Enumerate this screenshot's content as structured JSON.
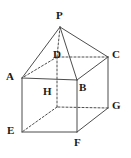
{
  "figure": {
    "background_color": "#ffffff",
    "stroke_color": "#4d4d4d",
    "label_color": "#1a1a1a",
    "solid_stroke_width": 1,
    "dashed_stroke_width": 1,
    "dash_pattern": "2,2",
    "canvas": {
      "width": 131,
      "height": 158
    },
    "vertices": [
      {
        "id": "P",
        "label": "P",
        "x": 60,
        "y": 27,
        "label_x": 56,
        "label_y": 10,
        "hidden": false
      },
      {
        "id": "A",
        "label": "A",
        "x": 22,
        "y": 78,
        "label_x": 6,
        "label_y": 71,
        "hidden": false
      },
      {
        "id": "B",
        "label": "B",
        "x": 77,
        "y": 80,
        "label_x": 79,
        "label_y": 82,
        "hidden": false
      },
      {
        "id": "C",
        "label": "C",
        "x": 108,
        "y": 57,
        "label_x": 112,
        "label_y": 49,
        "hidden": false
      },
      {
        "id": "D",
        "label": "D",
        "x": 57,
        "y": 57,
        "label_x": 53,
        "label_y": 49,
        "hidden": true
      },
      {
        "id": "E",
        "label": "E",
        "x": 22,
        "y": 132,
        "label_x": 7,
        "label_y": 125,
        "hidden": false
      },
      {
        "id": "F",
        "label": "F",
        "x": 77,
        "y": 132,
        "label_x": 74,
        "label_y": 137,
        "hidden": false
      },
      {
        "id": "G",
        "label": "G",
        "x": 108,
        "y": 108,
        "label_x": 112,
        "label_y": 100,
        "hidden": false
      },
      {
        "id": "H",
        "label": "H",
        "x": 57,
        "y": 107,
        "label_x": 43,
        "label_y": 86,
        "hidden": true
      }
    ],
    "edges": [
      {
        "from": "P",
        "to": "A",
        "style": "solid"
      },
      {
        "from": "P",
        "to": "B",
        "style": "solid"
      },
      {
        "from": "P",
        "to": "C",
        "style": "solid"
      },
      {
        "from": "P",
        "to": "D",
        "style": "dashed"
      },
      {
        "from": "A",
        "to": "B",
        "style": "solid"
      },
      {
        "from": "B",
        "to": "C",
        "style": "solid"
      },
      {
        "from": "C",
        "to": "D",
        "style": "dashed"
      },
      {
        "from": "D",
        "to": "A",
        "style": "dashed"
      },
      {
        "from": "A",
        "to": "E",
        "style": "solid"
      },
      {
        "from": "B",
        "to": "F",
        "style": "solid"
      },
      {
        "from": "C",
        "to": "G",
        "style": "solid"
      },
      {
        "from": "D",
        "to": "H",
        "style": "dashed"
      },
      {
        "from": "E",
        "to": "F",
        "style": "solid"
      },
      {
        "from": "F",
        "to": "G",
        "style": "solid"
      },
      {
        "from": "G",
        "to": "H",
        "style": "dashed"
      },
      {
        "from": "H",
        "to": "E",
        "style": "dashed"
      }
    ]
  }
}
